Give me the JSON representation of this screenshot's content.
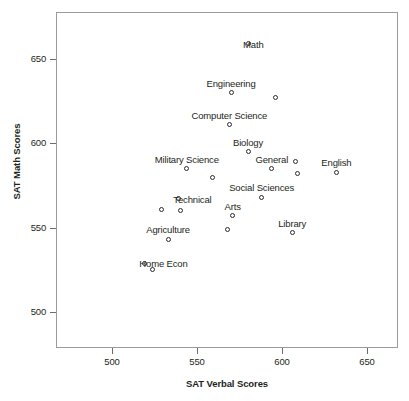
{
  "chart_data": {
    "type": "scatter",
    "title": "",
    "xlabel": "SAT Verbal Scores",
    "ylabel": "SAT Math Scores",
    "xlim": [
      468,
      669
    ],
    "ylim": [
      478,
      672
    ],
    "xticks": [
      500,
      550,
      600,
      650
    ],
    "yticks": [
      500,
      550,
      600,
      650
    ],
    "xtick_labels": [
      "500",
      "550",
      "600",
      "650"
    ],
    "ytick_labels": [
      "500",
      "550",
      "600",
      "650"
    ],
    "grid": false,
    "legend": "none",
    "marker": "open-circle",
    "points": [
      {
        "label": "Math",
        "x": 580,
        "y": 659,
        "label_dx": -28,
        "label_dy": -4
      },
      {
        "label": "Engineering",
        "x": 570,
        "y": 630,
        "label_dx": -24,
        "label_dy": -14
      },
      {
        "label": "",
        "x": 596,
        "y": 627,
        "label_dx": 0,
        "label_dy": 0
      },
      {
        "label": "Computer Science",
        "x": 569,
        "y": 611,
        "label_dx": -37,
        "label_dy": -14
      },
      {
        "label": "Biology",
        "x": 580,
        "y": 595,
        "label_dx": -16,
        "label_dy": -14
      },
      {
        "label": "Military Science",
        "x": 544,
        "y": 585,
        "label_dx": -34,
        "label_dy": -14
      },
      {
        "label": "General",
        "x": 594,
        "y": 585,
        "label_dx": -8,
        "label_dy": -14
      },
      {
        "label": "",
        "x": 608,
        "y": 589,
        "label_dx": 0,
        "label_dy": 0
      },
      {
        "label": "",
        "x": 609,
        "y": 582,
        "label_dx": 0,
        "label_dy": 0
      },
      {
        "label": "English",
        "x": 632,
        "y": 583,
        "label_dx": -16,
        "label_dy": -14
      },
      {
        "label": "",
        "x": 559,
        "y": 580,
        "label_dx": 0,
        "label_dy": 0
      },
      {
        "label": "Social Sciences",
        "x": 588,
        "y": 568,
        "label_dx": -46,
        "label_dy": -14
      },
      {
        "label": "Technical",
        "x": 539,
        "y": 567,
        "label_dx": -44,
        "label_dy": -4
      },
      {
        "label": "",
        "x": 529,
        "y": 561,
        "label_dx": 0,
        "label_dy": 0
      },
      {
        "label": "",
        "x": 540,
        "y": 560,
        "label_dx": 0,
        "label_dy": 0
      },
      {
        "label": "Arts",
        "x": 571,
        "y": 557,
        "label_dx": -9,
        "label_dy": -14
      },
      {
        "label": "",
        "x": 568,
        "y": 549,
        "label_dx": 0,
        "label_dy": 0
      },
      {
        "label": "Library",
        "x": 606,
        "y": 547,
        "label_dx": -14,
        "label_dy": -14
      },
      {
        "label": "Agriculture",
        "x": 533,
        "y": 543,
        "label_dx": -28,
        "label_dy": -14
      },
      {
        "label": "Home Econ",
        "x": 519,
        "y": 529,
        "label_dx": -52,
        "label_dy": -4
      },
      {
        "label": "",
        "x": 524,
        "y": 525,
        "label_dx": 0,
        "label_dy": 0
      }
    ]
  }
}
